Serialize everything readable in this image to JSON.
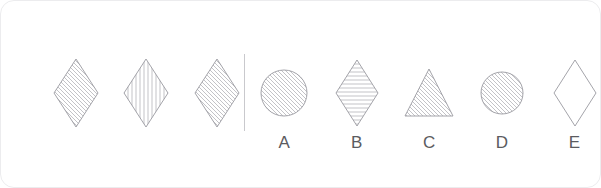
{
  "card": {
    "type": "visual-analogy-puzzle",
    "background_color": "#ffffff",
    "border_color": "#ececee",
    "stroke_color": "#9a9aa0",
    "hatch_color": "#b4b4b9",
    "label_color": "#5b5b60",
    "divider_color": "#c9c9cd"
  },
  "prompt": {
    "shapes": [
      {
        "name": "diamond",
        "fill_pattern": "diagonal-backslash",
        "width": 46,
        "height": 70
      },
      {
        "name": "diamond",
        "fill_pattern": "vertical",
        "width": 46,
        "height": 70
      },
      {
        "name": "diamond",
        "fill_pattern": "diagonal-backslash",
        "width": 46,
        "height": 70
      }
    ]
  },
  "divider": {
    "orientation": "vertical"
  },
  "options": [
    {
      "label": "A",
      "shape": "circle",
      "fill_pattern": "diagonal-backslash",
      "size": 48
    },
    {
      "label": "B",
      "shape": "diamond",
      "fill_pattern": "horizontal",
      "size": 44
    },
    {
      "label": "C",
      "shape": "triangle",
      "fill_pattern": "diagonal-backslash",
      "size": 50
    },
    {
      "label": "D",
      "shape": "circle",
      "fill_pattern": "diagonal-backslash",
      "size": 42
    },
    {
      "label": "E",
      "shape": "diamond",
      "fill_pattern": "none",
      "size": 44
    }
  ]
}
